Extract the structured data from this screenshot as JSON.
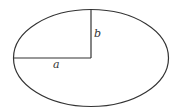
{
  "diagram": {
    "type": "ellipse",
    "center": [
      91,
      58
    ],
    "semi_major_axis_px": 77.5,
    "semi_minor_axis_px": 48.5,
    "stroke_color": "#333333",
    "background": "#ffffff",
    "labels": {
      "a": "a",
      "b": "b"
    }
  }
}
